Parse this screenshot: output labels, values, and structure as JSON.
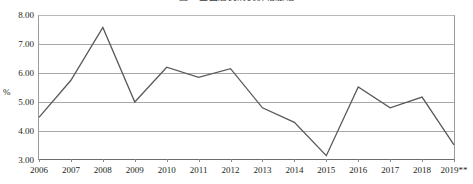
{
  "chart_data": {
    "type": "line",
    "title": "",
    "xlabel": "",
    "ylabel": "%",
    "ylim": [
      3.0,
      8.0
    ],
    "ytick_step": 1.0,
    "yticks": [
      "3.00",
      "4.00",
      "5.00",
      "6.00",
      "7.00",
      "8.00"
    ],
    "grid": true,
    "legend": false,
    "legend_position": "none",
    "categories": [
      "2006",
      "2007",
      "2008",
      "2009",
      "2010",
      "2011",
      "2012",
      "2013",
      "2014",
      "2015",
      "2016",
      "2017",
      "2018",
      "2019**"
    ],
    "values": [
      4.47,
      5.75,
      7.57,
      5.0,
      6.2,
      5.85,
      6.15,
      4.8,
      4.3,
      3.15,
      5.52,
      4.8,
      5.17,
      3.52
    ],
    "series": [
      {
        "name": "series-1",
        "color": "#595959",
        "values": [
          4.47,
          5.75,
          7.57,
          5.0,
          6.2,
          5.85,
          6.15,
          4.8,
          4.3,
          3.15,
          5.52,
          4.8,
          5.17,
          3.52
        ]
      }
    ],
    "annotations": [
      "2019**"
    ]
  },
  "axis": {
    "y_title": "%",
    "y_labels": [
      "8.00",
      "7.00",
      "6.00",
      "5.00",
      "4.00",
      "3.00"
    ],
    "x_labels": [
      "2006",
      "2007",
      "2008",
      "2009",
      "2010",
      "2011",
      "2012",
      "2013",
      "2014",
      "2015",
      "2016",
      "2017",
      "2018",
      "2019**"
    ]
  },
  "colors": {
    "line": "#595959",
    "grid": "#a8a8a8",
    "axis": "#6d6d6d",
    "text": "#231f20"
  },
  "title": {
    "text": "图 2  全国居民消费价格涨幅"
  }
}
